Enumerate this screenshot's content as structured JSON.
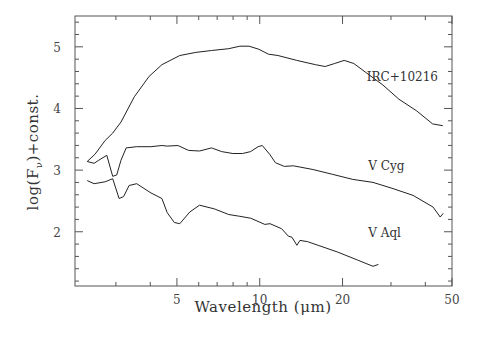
{
  "chart_data": {
    "type": "line",
    "title": "",
    "xlabel": "Wavelength (μm)",
    "ylabel": "log(F_ν)+const.",
    "xscale": "log",
    "xlim": [
      2.13,
      50
    ],
    "ylim": [
      1.12,
      5.5
    ],
    "grid": false,
    "legend": "inline labels",
    "x_ticks": [
      5,
      10,
      20,
      50
    ],
    "x_tick_labels": [
      "5",
      "10",
      "20",
      "50"
    ],
    "y_ticks": [
      2,
      3,
      4,
      5
    ],
    "y_tick_labels": [
      "2",
      "3",
      "4",
      "5"
    ],
    "series": [
      {
        "name": "IRC+10216",
        "label_pos": [
          24.5,
          4.44
        ],
        "points": [
          [
            2.36,
            3.14
          ],
          [
            2.52,
            3.26
          ],
          [
            2.74,
            3.48
          ],
          [
            2.92,
            3.6
          ],
          [
            3.13,
            3.78
          ],
          [
            3.5,
            4.19
          ],
          [
            3.96,
            4.52
          ],
          [
            4.41,
            4.71
          ],
          [
            5.12,
            4.86
          ],
          [
            5.86,
            4.91
          ],
          [
            6.68,
            4.94
          ],
          [
            7.71,
            4.97
          ],
          [
            8.46,
            5.01
          ],
          [
            9.15,
            5.01
          ],
          [
            9.93,
            4.96
          ],
          [
            10.76,
            4.88
          ],
          [
            11.64,
            4.86
          ],
          [
            13.64,
            4.78
          ],
          [
            15.96,
            4.71
          ],
          [
            17.3,
            4.68
          ],
          [
            18.72,
            4.73
          ],
          [
            20.28,
            4.78
          ],
          [
            21.98,
            4.73
          ],
          [
            24.39,
            4.58
          ],
          [
            28.03,
            4.38
          ],
          [
            32.06,
            4.15
          ],
          [
            37.2,
            3.96
          ],
          [
            42.5,
            3.75
          ],
          [
            46.3,
            3.72
          ]
        ]
      },
      {
        "name": "V Cyg",
        "label_pos": [
          24.8,
          3.0
        ],
        "points": [
          [
            2.36,
            3.14
          ],
          [
            2.5,
            3.11
          ],
          [
            2.6,
            3.16
          ],
          [
            2.78,
            3.24
          ],
          [
            2.92,
            2.9
          ],
          [
            3.02,
            2.92
          ],
          [
            3.13,
            3.16
          ],
          [
            3.27,
            3.36
          ],
          [
            3.57,
            3.38
          ],
          [
            4.02,
            3.38
          ],
          [
            4.41,
            3.4
          ],
          [
            4.61,
            3.39
          ],
          [
            5.04,
            3.4
          ],
          [
            5.51,
            3.32
          ],
          [
            6.04,
            3.31
          ],
          [
            6.68,
            3.36
          ],
          [
            7.27,
            3.3
          ],
          [
            7.98,
            3.27
          ],
          [
            8.66,
            3.27
          ],
          [
            9.26,
            3.3
          ],
          [
            9.86,
            3.38
          ],
          [
            10.22,
            3.4
          ],
          [
            10.9,
            3.25
          ],
          [
            11.4,
            3.12
          ],
          [
            12.28,
            3.06
          ],
          [
            13.26,
            3.07
          ],
          [
            15.6,
            3.01
          ],
          [
            18.43,
            2.93
          ],
          [
            21.79,
            2.85
          ],
          [
            25.8,
            2.8
          ],
          [
            30.5,
            2.7
          ],
          [
            36.1,
            2.59
          ],
          [
            42.7,
            2.4
          ],
          [
            45.3,
            2.24
          ],
          [
            46.5,
            2.3
          ]
        ]
      },
      {
        "name": "V Aql",
        "label_pos": [
          24.8,
          1.92
        ],
        "points": [
          [
            2.36,
            2.83
          ],
          [
            2.5,
            2.78
          ],
          [
            2.74,
            2.81
          ],
          [
            2.92,
            2.86
          ],
          [
            3.08,
            2.54
          ],
          [
            3.2,
            2.57
          ],
          [
            3.35,
            2.75
          ],
          [
            3.57,
            2.78
          ],
          [
            4.02,
            2.63
          ],
          [
            4.41,
            2.54
          ],
          [
            4.61,
            2.31
          ],
          [
            4.89,
            2.15
          ],
          [
            5.12,
            2.13
          ],
          [
            5.57,
            2.32
          ],
          [
            6.04,
            2.43
          ],
          [
            6.84,
            2.37
          ],
          [
            7.71,
            2.28
          ],
          [
            8.46,
            2.25
          ],
          [
            9.26,
            2.22
          ],
          [
            10.43,
            2.12
          ],
          [
            10.9,
            2.13
          ],
          [
            12.01,
            2.05
          ],
          [
            12.7,
            1.93
          ],
          [
            13.1,
            1.91
          ],
          [
            13.65,
            1.78
          ],
          [
            14.0,
            1.86
          ],
          [
            14.9,
            1.84
          ],
          [
            16.3,
            1.78
          ],
          [
            19.2,
            1.67
          ],
          [
            22.7,
            1.54
          ],
          [
            25.8,
            1.44
          ],
          [
            27.0,
            1.47
          ]
        ]
      }
    ]
  },
  "plot_frame": {
    "left": 75,
    "right": 452,
    "top": 16,
    "bottom": 286
  }
}
